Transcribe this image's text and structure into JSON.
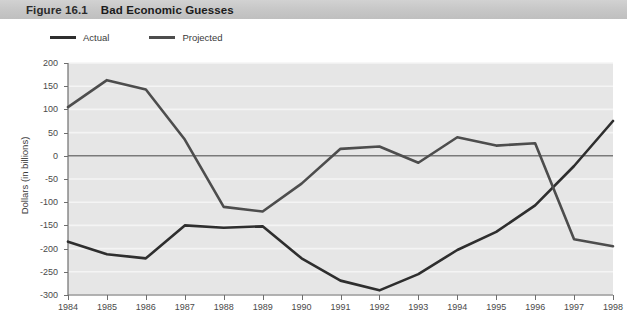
{
  "figure": {
    "number": "Figure 16.1",
    "title": "Bad Economic Guesses"
  },
  "legend": {
    "position": "top-left",
    "items": [
      {
        "label": "Actual",
        "color": "#2e2e2e"
      },
      {
        "label": "Projected",
        "color": "#4d4d4d"
      }
    ]
  },
  "colors": {
    "banner": "#c8c8c8",
    "plot_background": "#e6e6e6",
    "gridline": "#f4f4f4",
    "zero_line": "#7a7a7a",
    "axis": "#6e6e6e",
    "actual_line": "#2e2e2e",
    "projected_line": "#4d4d4d"
  },
  "chart_data": {
    "type": "line",
    "title": "Bad Economic Guesses",
    "xlabel": "",
    "ylabel": "Dollars (in billions)",
    "categories": [
      "1984",
      "1985",
      "1986",
      "1987",
      "1988",
      "1989",
      "1990",
      "1991",
      "1992",
      "1993",
      "1994",
      "1995",
      "1996",
      "1997",
      "1998"
    ],
    "ylim": [
      -300,
      200
    ],
    "yticks": [
      200,
      150,
      100,
      50,
      0,
      -50,
      -100,
      -150,
      -200,
      -250,
      -300
    ],
    "ytick_labels": [
      "200",
      "150",
      "100",
      "50",
      "0",
      "-50",
      "-100",
      "-150",
      "-200",
      "-250",
      "-300"
    ],
    "grid": true,
    "legend_position": "above-plot-left",
    "series": [
      {
        "name": "Actual",
        "color": "#2e2e2e",
        "values": [
          -185,
          -212,
          -221,
          -150,
          -155,
          -152,
          -221,
          -269,
          -290,
          -255,
          -203,
          -164,
          -107,
          -22,
          75
        ]
      },
      {
        "name": "Projected",
        "color": "#4d4d4d",
        "values": [
          105,
          163,
          143,
          35,
          -110,
          -120,
          -60,
          15,
          20,
          -15,
          40,
          22,
          27,
          -180,
          -195
        ]
      }
    ]
  }
}
